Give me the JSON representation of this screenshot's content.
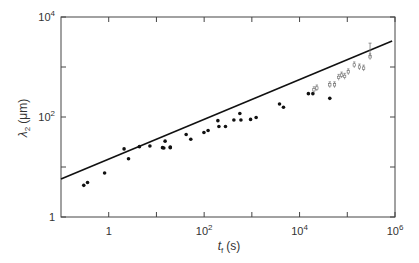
{
  "chart_data": {
    "type": "scatter",
    "title": "",
    "xlabel": "t_f (s)",
    "ylabel": "λ2 (μm)",
    "xscale": "log",
    "yscale": "log",
    "xlim": [
      0.1,
      1000000
    ],
    "ylim": [
      1,
      10000
    ],
    "grid": false,
    "legend": null,
    "x_ticks": [
      {
        "value": 1,
        "label": "1"
      },
      {
        "value": 100,
        "label": "10",
        "exp": "2"
      },
      {
        "value": 10000,
        "label": "10",
        "exp": "4"
      },
      {
        "value": 1000000,
        "label": "10",
        "exp": "6"
      }
    ],
    "x_minor_ticks": [
      10,
      1000,
      100000
    ],
    "y_ticks": [
      {
        "value": 1,
        "label": "1"
      },
      {
        "value": 100,
        "label": "10",
        "exp": "2"
      },
      {
        "value": 10000,
        "label": "10",
        "exp": "4"
      }
    ],
    "y_minor_ticks": [
      10,
      1000
    ],
    "series": [
      {
        "name": "filled",
        "marker": "filled-circle",
        "points": [
          [
            0.3,
            4.3
          ],
          [
            0.36,
            4.9
          ],
          [
            0.82,
            7.6
          ],
          [
            2.1,
            23.0
          ],
          [
            2.6,
            14.6
          ],
          [
            4.4,
            25.5
          ],
          [
            7.3,
            26.3
          ],
          [
            13.4,
            24.4
          ],
          [
            15.2,
            32.9
          ],
          [
            19.5,
            24.4
          ],
          [
            14.3,
            24.0
          ],
          [
            19.5,
            25.0
          ],
          [
            42.0,
            44.7
          ],
          [
            52.5,
            35.9
          ],
          [
            99.0,
            49.0
          ],
          [
            121.0,
            53.7
          ],
          [
            194.0,
            84.5
          ],
          [
            204.0,
            64.6
          ],
          [
            280.0,
            64.6
          ],
          [
            420.0,
            87.1
          ],
          [
            560.0,
            117.5
          ],
          [
            590.0,
            87.1
          ],
          [
            940.0,
            89.5
          ],
          [
            1230.0,
            97.7
          ],
          [
            3800.0,
            182.0
          ],
          [
            4600.0,
            157.0
          ],
          [
            15300.0,
            293.0
          ],
          [
            19000.0,
            293.0
          ],
          [
            43000.0,
            236.0
          ]
        ]
      },
      {
        "name": "open-with-error-bars",
        "marker": "open-square",
        "points": [
          [
            20000.0,
            350.0
          ],
          [
            23000.0,
            380.0
          ],
          [
            43000.0,
            440.0
          ],
          [
            54000.0,
            440.0
          ],
          [
            66000.0,
            620.0
          ],
          [
            76000.0,
            690.0
          ],
          [
            88000.0,
            650.0
          ],
          [
            105000.0,
            800.0
          ],
          [
            140000.0,
            1100.0
          ],
          [
            180000.0,
            1000.0
          ],
          [
            220000.0,
            950.0
          ],
          [
            300000.0,
            1600.0
          ]
        ],
        "error_bar_top_example": [
          300000.0,
          3000.0
        ]
      }
    ],
    "fit_line": {
      "style": "solid",
      "from": [
        0.1,
        5.75
      ],
      "to": [
        870000.0,
        3300.0
      ],
      "slope_loglog": 0.4
    }
  },
  "axes": {
    "x_label_main": "t",
    "x_label_sub": "f",
    "x_label_unit": "(s)",
    "y_label_main": "λ",
    "y_label_sub": "2",
    "y_label_unit": "(μm)"
  }
}
